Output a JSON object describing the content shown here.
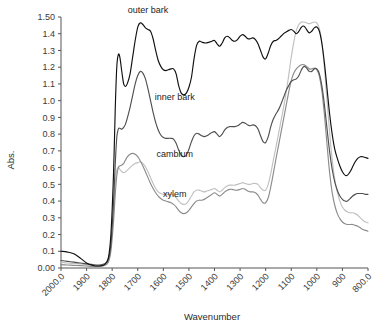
{
  "chart_data": {
    "type": "line",
    "title": "",
    "xlabel": "Wavenumber",
    "ylabel": "Abs.",
    "xlim": [
      2000.0,
      800.0
    ],
    "ylim": [
      0.0,
      1.5
    ],
    "x_reversed": true,
    "grid": false,
    "legend_position": "inline-annotations",
    "xticklabels": [
      "2000.0",
      "1900",
      "1800",
      "1700",
      "1600",
      "1500",
      "1400",
      "1300",
      "1200",
      "1100",
      "1000",
      "900",
      "800.0"
    ],
    "xtickvalues": [
      2000,
      1900,
      1800,
      1700,
      1600,
      1500,
      1400,
      1300,
      1200,
      1100,
      1000,
      900,
      800
    ],
    "yticklabels": [
      "0.00",
      "0.1",
      "0.2",
      "0.3",
      "0.4",
      "0.5",
      "0.6",
      "0.7",
      "0.8",
      "0.9",
      "1.0",
      "1.1",
      "1.2",
      "1.3",
      "1.4",
      "1.50"
    ],
    "ytickvalues": [
      0.0,
      0.1,
      0.2,
      0.3,
      0.4,
      0.5,
      0.6,
      0.7,
      0.8,
      0.9,
      1.0,
      1.1,
      1.2,
      1.3,
      1.4,
      1.5
    ],
    "x": [
      2000,
      1975,
      1950,
      1925,
      1900,
      1875,
      1850,
      1830,
      1815,
      1805,
      1795,
      1788,
      1782,
      1776,
      1770,
      1762,
      1755,
      1748,
      1740,
      1730,
      1720,
      1710,
      1700,
      1690,
      1680,
      1670,
      1660,
      1650,
      1640,
      1630,
      1620,
      1610,
      1600,
      1590,
      1580,
      1570,
      1560,
      1550,
      1540,
      1530,
      1520,
      1510,
      1500,
      1490,
      1480,
      1470,
      1460,
      1450,
      1440,
      1430,
      1420,
      1410,
      1400,
      1390,
      1380,
      1370,
      1360,
      1350,
      1340,
      1330,
      1320,
      1310,
      1300,
      1290,
      1280,
      1270,
      1260,
      1250,
      1240,
      1230,
      1220,
      1210,
      1200,
      1190,
      1180,
      1170,
      1160,
      1150,
      1140,
      1130,
      1120,
      1110,
      1100,
      1090,
      1080,
      1070,
      1060,
      1050,
      1040,
      1030,
      1020,
      1010,
      1000,
      990,
      980,
      970,
      960,
      950,
      940,
      930,
      920,
      910,
      900,
      890,
      880,
      870,
      860,
      850,
      840,
      830,
      820,
      810,
      800
    ],
    "series": [
      {
        "name": "outer bark",
        "color": "#101010",
        "label_x": 1660,
        "label_y": 1.54,
        "values": [
          0.1,
          0.095,
          0.085,
          0.06,
          0.03,
          0.015,
          0.012,
          0.02,
          0.06,
          0.2,
          0.55,
          0.95,
          1.2,
          1.275,
          1.26,
          1.17,
          1.1,
          1.085,
          1.105,
          1.16,
          1.26,
          1.36,
          1.44,
          1.465,
          1.455,
          1.435,
          1.425,
          1.415,
          1.37,
          1.3,
          1.24,
          1.205,
          1.185,
          1.18,
          1.185,
          1.19,
          1.19,
          1.16,
          1.09,
          1.045,
          1.035,
          1.045,
          1.08,
          1.14,
          1.25,
          1.33,
          1.355,
          1.35,
          1.345,
          1.345,
          1.35,
          1.355,
          1.36,
          1.34,
          1.325,
          1.345,
          1.375,
          1.385,
          1.375,
          1.36,
          1.355,
          1.365,
          1.385,
          1.395,
          1.385,
          1.37,
          1.37,
          1.375,
          1.365,
          1.34,
          1.3,
          1.26,
          1.25,
          1.285,
          1.33,
          1.355,
          1.36,
          1.37,
          1.385,
          1.4,
          1.41,
          1.42,
          1.425,
          1.415,
          1.4,
          1.415,
          1.44,
          1.445,
          1.425,
          1.405,
          1.415,
          1.435,
          1.44,
          1.415,
          1.34,
          1.22,
          1.07,
          0.92,
          0.8,
          0.71,
          0.655,
          0.61,
          0.575,
          0.555,
          0.555,
          0.575,
          0.605,
          0.635,
          0.655,
          0.665,
          0.665,
          0.66,
          0.655
        ]
      },
      {
        "name": "inner bark",
        "color": "#4f4f4f",
        "label_x": 1555,
        "label_y": 1.02,
        "values": [
          0.045,
          0.04,
          0.035,
          0.03,
          0.025,
          0.02,
          0.018,
          0.025,
          0.05,
          0.14,
          0.38,
          0.62,
          0.78,
          0.83,
          0.835,
          0.83,
          0.84,
          0.86,
          0.9,
          0.96,
          1.03,
          1.1,
          1.15,
          1.175,
          1.165,
          1.13,
          1.07,
          1.0,
          0.93,
          0.87,
          0.825,
          0.795,
          0.78,
          0.775,
          0.775,
          0.775,
          0.77,
          0.745,
          0.705,
          0.675,
          0.665,
          0.675,
          0.71,
          0.755,
          0.79,
          0.805,
          0.8,
          0.79,
          0.785,
          0.79,
          0.8,
          0.81,
          0.815,
          0.8,
          0.785,
          0.8,
          0.825,
          0.84,
          0.845,
          0.845,
          0.845,
          0.85,
          0.86,
          0.87,
          0.865,
          0.855,
          0.85,
          0.855,
          0.85,
          0.83,
          0.79,
          0.755,
          0.75,
          0.785,
          0.845,
          0.89,
          0.92,
          0.945,
          0.98,
          1.02,
          1.06,
          1.09,
          1.115,
          1.125,
          1.13,
          1.15,
          1.185,
          1.205,
          1.195,
          1.175,
          1.175,
          1.19,
          1.19,
          1.16,
          1.085,
          0.97,
          0.83,
          0.695,
          0.59,
          0.515,
          0.465,
          0.43,
          0.41,
          0.4,
          0.4,
          0.415,
          0.43,
          0.44,
          0.445,
          0.445,
          0.445,
          0.44,
          0.44
        ]
      },
      {
        "name": "cambium",
        "color": "#c0c0c0",
        "label_x": 1555,
        "label_y": 0.68,
        "values": [
          0.035,
          0.03,
          0.027,
          0.024,
          0.02,
          0.016,
          0.014,
          0.02,
          0.045,
          0.13,
          0.33,
          0.5,
          0.585,
          0.6,
          0.59,
          0.575,
          0.57,
          0.575,
          0.585,
          0.6,
          0.615,
          0.625,
          0.63,
          0.635,
          0.625,
          0.605,
          0.575,
          0.54,
          0.505,
          0.475,
          0.455,
          0.445,
          0.44,
          0.44,
          0.44,
          0.44,
          0.435,
          0.42,
          0.4,
          0.385,
          0.38,
          0.385,
          0.405,
          0.43,
          0.455,
          0.465,
          0.465,
          0.46,
          0.455,
          0.46,
          0.465,
          0.47,
          0.475,
          0.465,
          0.455,
          0.465,
          0.48,
          0.49,
          0.495,
          0.495,
          0.495,
          0.5,
          0.505,
          0.51,
          0.505,
          0.5,
          0.5,
          0.505,
          0.505,
          0.5,
          0.48,
          0.465,
          0.465,
          0.5,
          0.565,
          0.645,
          0.72,
          0.8,
          0.88,
          0.96,
          1.05,
          1.15,
          1.26,
          1.35,
          1.42,
          1.455,
          1.47,
          1.47,
          1.465,
          1.46,
          1.465,
          1.47,
          1.465,
          1.43,
          1.34,
          1.19,
          1.0,
          0.81,
          0.65,
          0.53,
          0.455,
          0.4,
          0.365,
          0.345,
          0.335,
          0.33,
          0.33,
          0.325,
          0.315,
          0.3,
          0.285,
          0.275,
          0.27
        ]
      },
      {
        "name": "xylem",
        "color": "#8c8c8c",
        "label_x": 1555,
        "label_y": 0.44,
        "values": [
          0.02,
          0.018,
          0.016,
          0.014,
          0.012,
          0.01,
          0.01,
          0.015,
          0.035,
          0.1,
          0.27,
          0.44,
          0.55,
          0.6,
          0.61,
          0.615,
          0.625,
          0.645,
          0.665,
          0.68,
          0.685,
          0.68,
          0.665,
          0.64,
          0.61,
          0.575,
          0.54,
          0.505,
          0.475,
          0.45,
          0.43,
          0.415,
          0.405,
          0.4,
          0.395,
          0.39,
          0.38,
          0.365,
          0.345,
          0.33,
          0.325,
          0.33,
          0.345,
          0.365,
          0.385,
          0.4,
          0.405,
          0.405,
          0.41,
          0.42,
          0.43,
          0.44,
          0.45,
          0.44,
          0.43,
          0.44,
          0.455,
          0.465,
          0.47,
          0.47,
          0.465,
          0.465,
          0.47,
          0.475,
          0.47,
          0.46,
          0.455,
          0.455,
          0.45,
          0.435,
          0.41,
          0.39,
          0.39,
          0.42,
          0.485,
          0.565,
          0.65,
          0.73,
          0.81,
          0.89,
          0.97,
          1.05,
          1.12,
          1.165,
          1.19,
          1.205,
          1.215,
          1.215,
          1.205,
          1.19,
          1.19,
          1.195,
          1.185,
          1.145,
          1.055,
          0.91,
          0.735,
          0.57,
          0.45,
          0.375,
          0.325,
          0.295,
          0.275,
          0.265,
          0.26,
          0.26,
          0.26,
          0.255,
          0.25,
          0.24,
          0.23,
          0.225,
          0.22
        ]
      }
    ]
  }
}
